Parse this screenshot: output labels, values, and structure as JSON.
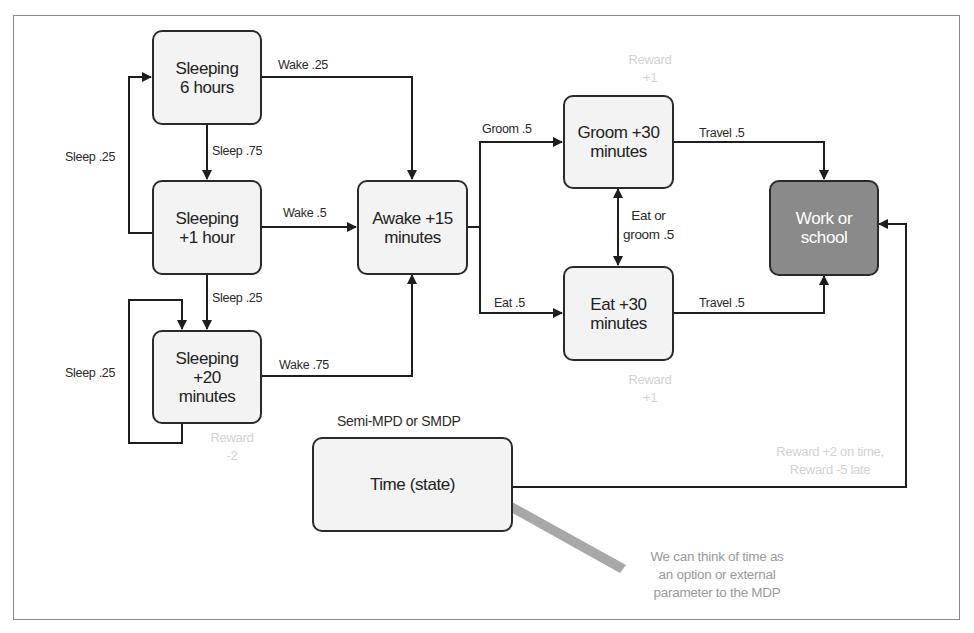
{
  "diagram": {
    "title": "Semi-MPD or SMDP",
    "nodes": {
      "sleep6": {
        "label": "Sleeping\n6 hours"
      },
      "sleep1": {
        "label": "Sleeping\n+1 hour"
      },
      "sleep20": {
        "label": "Sleeping\n+20\nminutes"
      },
      "awake": {
        "label": "Awake +15\nminutes"
      },
      "groom": {
        "label": "Groom +30\nminutes"
      },
      "eat": {
        "label": "Eat +30\nminutes"
      },
      "work": {
        "label": "Work or\nschool"
      },
      "time": {
        "label": "Time (state)"
      }
    },
    "edges": {
      "sleep6_wake": "Wake .25",
      "sleep6_sleep": "Sleep .75",
      "sleep1_back": "Sleep .25",
      "sleep1_wake": "Wake .5",
      "sleep1_sleep": "Sleep .25",
      "sleep20_loop": "Sleep .25",
      "sleep20_wake": "Wake .75",
      "awake_groom": "Groom .5",
      "awake_eat": "Eat .5",
      "groom_eat": "Eat or\ngroom .5",
      "groom_travel": "Travel .5",
      "eat_travel": "Travel .5"
    },
    "rewards": {
      "groom": "Reward\n+1",
      "eat": "Reward\n+1",
      "sleep20": "Reward\n-2",
      "work": "Reward +2 on time,\nReward -5 late"
    },
    "note": "We can think of time as\nan option or external\nparameter to the MDP",
    "colors": {
      "node_fill": "#f3f3f3",
      "terminal_fill": "#8a8a8a",
      "stroke": "#2a2a2a",
      "reward_text": "#d2d2d2",
      "note_arrow": "#a8a8a8"
    }
  }
}
